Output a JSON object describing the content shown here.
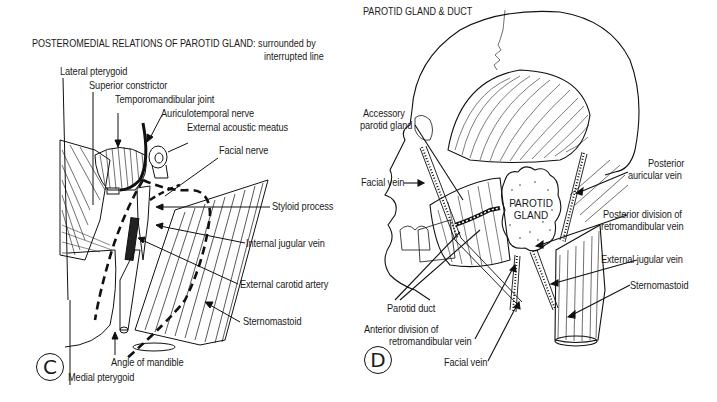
{
  "panel_c": {
    "badge": "C",
    "title_line1": "POSTEROMEDIAL RELATIONS OF PAROTID GLAND: surrounded by",
    "title_line2": "interrupted line",
    "labels": {
      "lateral_pterygoid": "Lateral pterygoid",
      "superior_constrictor": "Superior constrictor",
      "temporomandibular_joint": "Temporomandibular joint",
      "auriculotemporal_nerve": "Auriculotemporal nerve",
      "external_acoustic_meatus": "External acoustic meatus",
      "facial_nerve": "Facial nerve",
      "styloid_process": "Styloid process",
      "internal_jugular_vein": "Internal jugular vein",
      "external_carotid_artery": "External carotid artery",
      "sternomastoid": "Sternomastoid",
      "angle_of_mandible": "Angle of mandible",
      "medial_pterygoid": "Medial pterygoid"
    }
  },
  "panel_d": {
    "badge": "D",
    "title": "PAROTID GLAND & DUCT",
    "gland_label_line1": "PAROTID",
    "gland_label_line2": "GLAND",
    "labels": {
      "accessory_parotid_line1": "Accessory",
      "accessory_parotid_line2": "parotid gland",
      "facial_vein_upper": "Facial vein",
      "posterior_auricular_line1": "Posterior",
      "posterior_auricular_line2": "auricular vein",
      "posterior_division_line1": "Posterior division of",
      "posterior_division_line2": "retromandibular vein",
      "external_jugular_vein": "External jugular vein",
      "sternomastoid": "Sternomastoid",
      "parotid_duct": "Parotid duct",
      "anterior_division_line1": "Anterior division of",
      "anterior_division_line2": "retromandibular vein",
      "facial_vein_lower": "Facial vein"
    }
  }
}
